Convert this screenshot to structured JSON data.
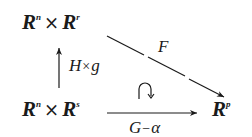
{
  "diagram": {
    "nodes": {
      "top_left": {
        "base1": "R",
        "exp1": "n",
        "op": "×",
        "base2": "R",
        "exp2": "r"
      },
      "bottom_left": {
        "base1": "R",
        "exp1": "n",
        "op": "×",
        "base2": "R",
        "exp2": "s"
      },
      "bottom_right": {
        "base": "R",
        "exp": "p"
      }
    },
    "arrows": {
      "vertical": {
        "label_a": "H",
        "label_op": "×",
        "label_b": "g"
      },
      "diagonal": {
        "label": "F"
      },
      "horizontal": {
        "label_a": "G",
        "label_op": "−",
        "label_b": "α"
      }
    },
    "commutes_symbol": "clockwise-curved-arrow"
  }
}
